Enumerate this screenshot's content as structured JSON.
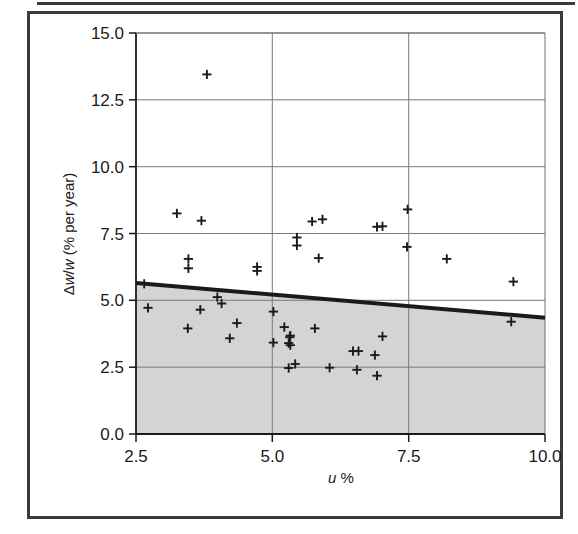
{
  "figure": {
    "frame_color": "#3b3b3b",
    "background": "#ffffff"
  },
  "chart_data": {
    "type": "scatter",
    "title": "",
    "subtitle": "",
    "xlabel": "u %",
    "ylabel": "Δw/w (% per year)",
    "xlim": [
      2.5,
      10.0
    ],
    "ylim": [
      0.0,
      15.0
    ],
    "xticks": [
      "2.5",
      "5.0",
      "7.5",
      "10.0"
    ],
    "xtick_values": [
      2.5,
      5.0,
      7.5,
      10.0
    ],
    "yticks": [
      "0.0",
      "2.5",
      "5.0",
      "7.5",
      "10.0",
      "12.5",
      "15.0"
    ],
    "ytick_values": [
      0.0,
      2.5,
      5.0,
      7.5,
      10.0,
      12.5,
      15.0
    ],
    "grid": true,
    "grid_color": "#808080",
    "legend": "none",
    "marker": "plus",
    "marker_color": "#1a1a1a",
    "series": [
      {
        "name": "observations",
        "points": [
          [
            3.8,
            13.45
          ],
          [
            3.25,
            8.25
          ],
          [
            7.48,
            8.4
          ],
          [
            3.7,
            7.98
          ],
          [
            5.73,
            7.95
          ],
          [
            5.92,
            8.03
          ],
          [
            6.92,
            7.75
          ],
          [
            7.02,
            7.77
          ],
          [
            5.45,
            7.35
          ],
          [
            5.45,
            7.05
          ],
          [
            7.47,
            7.0
          ],
          [
            3.46,
            6.55
          ],
          [
            5.85,
            6.58
          ],
          [
            8.2,
            6.55
          ],
          [
            3.46,
            6.2
          ],
          [
            4.72,
            6.25
          ],
          [
            4.72,
            6.1
          ],
          [
            9.42,
            5.7
          ],
          [
            2.65,
            5.62
          ],
          [
            3.99,
            5.12
          ],
          [
            4.07,
            4.88
          ],
          [
            2.72,
            4.72
          ],
          [
            3.68,
            4.65
          ],
          [
            5.02,
            4.58
          ],
          [
            9.38,
            4.2
          ],
          [
            4.35,
            4.15
          ],
          [
            5.22,
            4.0
          ],
          [
            3.45,
            3.95
          ],
          [
            5.78,
            3.95
          ],
          [
            5.33,
            3.68
          ],
          [
            5.32,
            3.62
          ],
          [
            4.22,
            3.58
          ],
          [
            7.02,
            3.65
          ],
          [
            5.02,
            3.42
          ],
          [
            5.3,
            3.4
          ],
          [
            5.33,
            3.32
          ],
          [
            6.48,
            3.1
          ],
          [
            6.58,
            3.1
          ],
          [
            6.88,
            2.95
          ],
          [
            5.42,
            2.62
          ],
          [
            5.3,
            2.47
          ],
          [
            6.05,
            2.48
          ],
          [
            6.55,
            2.4
          ],
          [
            6.92,
            2.18
          ]
        ]
      }
    ],
    "trend_line": {
      "name": "threshold line",
      "color": "#1a1a1a",
      "width": 4,
      "x_start": 2.5,
      "y_start": 5.65,
      "x_end": 10.0,
      "y_end": 4.35
    },
    "shaded_region": {
      "name": "area below trend line",
      "color": "#d4d4d4",
      "description": "region between y=0 and the trend line"
    }
  }
}
